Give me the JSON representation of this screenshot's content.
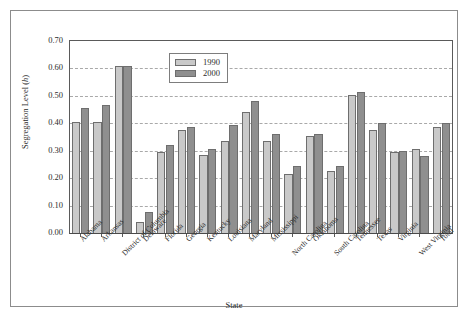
{
  "chart_data": {
    "type": "bar",
    "title": "",
    "xlabel": "State",
    "ylabel": "Segregation Level (h)",
    "ylabel_prefix": "Segregation Level (",
    "ylabel_italic": "h",
    "ylabel_suffix": ")",
    "ylim": [
      0.0,
      0.7
    ],
    "ytick_labels": [
      "0.70",
      "0.60",
      "0.50",
      "0.40",
      "0.30",
      "0.20",
      "0.10",
      "0.00"
    ],
    "ytick_values": [
      0.7,
      0.6,
      0.5,
      0.4,
      0.3,
      0.2,
      0.1,
      0.0
    ],
    "grid": "horizontal-dashed",
    "legend_position": "top-center",
    "categories": [
      "Alabama",
      "Arkansas",
      "District of Columbia",
      "Delaware",
      "Florida",
      "Georgia",
      "Kentucky",
      "Louisiana",
      "Maryland",
      "Mississippi",
      "North Carolina",
      "Oklahoma",
      "South Carolina",
      "Tennessee",
      "Texas",
      "Virginia",
      "West Virginia",
      "Total"
    ],
    "series": [
      {
        "name": "1990",
        "color": "#c9c9c9",
        "values": [
          0.405,
          0.405,
          0.61,
          0.04,
          0.295,
          0.375,
          0.285,
          0.335,
          0.44,
          0.335,
          0.215,
          0.355,
          0.225,
          0.505,
          0.375,
          0.295,
          0.305,
          0.385
        ]
      },
      {
        "name": "2000",
        "color": "#8f8f8f",
        "values": [
          0.455,
          0.465,
          0.61,
          0.075,
          0.32,
          0.385,
          0.305,
          0.395,
          0.48,
          0.36,
          0.245,
          0.36,
          0.245,
          0.515,
          0.4,
          0.3,
          0.28,
          0.4
        ]
      }
    ]
  },
  "legend": {
    "items": [
      {
        "label": "1990",
        "swatch": "light-gray-swatch"
      },
      {
        "label": "2000",
        "swatch": "dark-gray-swatch"
      }
    ]
  }
}
